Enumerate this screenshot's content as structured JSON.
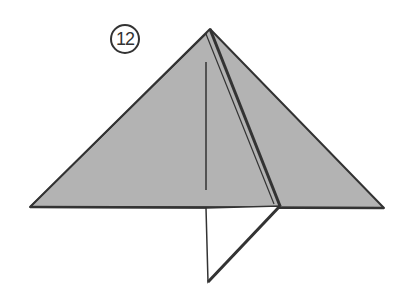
{
  "step": {
    "number": "12"
  },
  "colors": {
    "paper_fill": "#b3b3b3",
    "line": "#333333",
    "background": "#ffffff"
  },
  "shapes": {
    "triangle": {
      "apex": [
        210,
        29
      ],
      "left": [
        30,
        207
      ],
      "right": [
        384,
        208
      ]
    },
    "inner_vertical_line": {
      "from": [
        206,
        62
      ],
      "to": [
        206,
        190
      ]
    },
    "fold_line": {
      "from": [
        210,
        29
      ],
      "to": [
        280,
        206
      ]
    },
    "lower_flap": {
      "points": [
        [
          206,
          208
        ],
        [
          208,
          282
        ],
        [
          280,
          206
        ]
      ]
    }
  }
}
